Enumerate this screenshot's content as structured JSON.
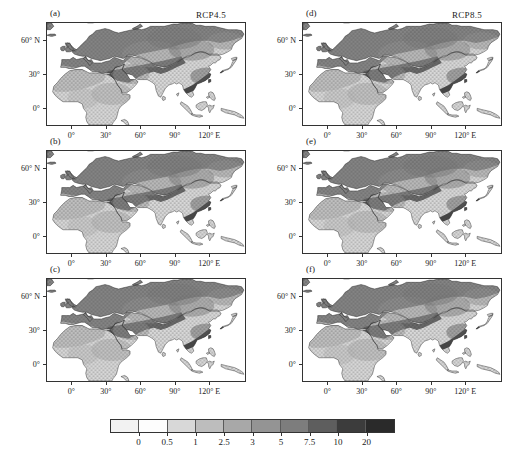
{
  "figure": {
    "column_titles": [
      "RCP4.5",
      "RCP8.5"
    ],
    "panels": [
      {
        "label": "(a)",
        "row": 0,
        "col": 0,
        "scenario": "RCP4.5"
      },
      {
        "label": "(b)",
        "row": 1,
        "col": 0,
        "scenario": "RCP4.5"
      },
      {
        "label": "(c)",
        "row": 2,
        "col": 0,
        "scenario": "RCP4.5"
      },
      {
        "label": "(d)",
        "row": 0,
        "col": 1,
        "scenario": "RCP8.5"
      },
      {
        "label": "(e)",
        "row": 1,
        "col": 1,
        "scenario": "RCP8.5"
      },
      {
        "label": "(f)",
        "row": 2,
        "col": 1,
        "scenario": "RCP8.5"
      }
    ]
  },
  "axes": {
    "x_ticks": [
      "0°",
      "30°",
      "60°",
      "90°",
      "120° E"
    ],
    "x_tick_values": [
      0,
      30,
      60,
      90,
      120
    ],
    "y_ticks": [
      "60° N",
      "30°",
      "0°"
    ],
    "y_tick_values": [
      60,
      30,
      0
    ],
    "xlim": [
      -22,
      152
    ],
    "ylim": [
      -16,
      76
    ]
  },
  "chart_data": {
    "type": "heatmap",
    "title": "",
    "subtitle": "",
    "xlabel": "",
    "ylabel": "",
    "grid": false,
    "legend_position": "bottom",
    "panel_count": 6,
    "map_region": "Africa – Eurasia",
    "colorbar": {
      "orientation": "horizontal",
      "tick_labels": [
        "0",
        "0.5",
        "1",
        "2.5",
        "3",
        "5",
        "7.5",
        "10",
        "20"
      ],
      "boundaries": [
        0,
        0.5,
        1,
        2.5,
        3,
        5,
        7.5,
        10,
        20
      ],
      "colors": [
        "#f2f2f2",
        "#fdfdfd",
        "#d8d8d8",
        "#bdbdbd",
        "#a8a8a8",
        "#949494",
        "#7d7d7d",
        "#5e5e5e",
        "#3c3c3c",
        "#2a2a2a"
      ],
      "extend_low": true,
      "extend_high": true
    },
    "overlay": {
      "name": "stippling",
      "description": "dot hatching over shaded land areas"
    }
  }
}
